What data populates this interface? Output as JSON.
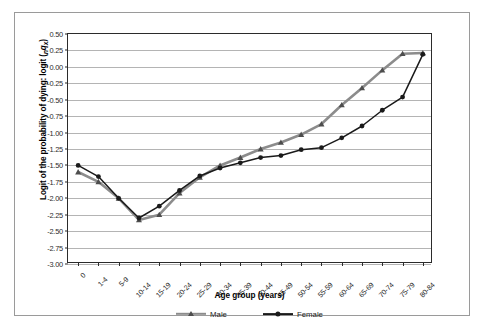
{
  "chart_data": {
    "type": "line",
    "title": "",
    "xlabel": "Age group (years)",
    "ylabel": "Logit of the probability of dying: logit (nqx)",
    "ylabel_parts": {
      "main": "Logit of the probability of dying: logit (",
      "sub_n": "n",
      "var_q": "q",
      "sub_x": "x",
      "close": ")"
    },
    "categories": [
      "0",
      "1-4",
      "5-9",
      "10-14",
      "15-19",
      "20-24",
      "25-29",
      "30-34",
      "35-39",
      "40-44",
      "45-49",
      "50-54",
      "55-59",
      "60-64",
      "65-69",
      "70-74",
      "75-79",
      "80-84"
    ],
    "ylim": [
      -3.0,
      0.5
    ],
    "ytick_labels": [
      "0.50",
      "0.25",
      "0.00",
      "-0.25",
      "-0.50",
      "-0.75",
      "-1.00",
      "-1.25",
      "-1.50",
      "-1.75",
      "-2.00",
      "-2.25",
      "-2.50",
      "-2.75",
      "-3.00"
    ],
    "ytick_values": [
      0.5,
      0.25,
      0.0,
      -0.25,
      -0.5,
      -0.75,
      -1.0,
      -1.25,
      -1.5,
      -1.75,
      -2.0,
      -2.25,
      -2.5,
      -2.75,
      -3.0
    ],
    "grid": true,
    "legend_position": "bottom",
    "series": [
      {
        "name": "Male",
        "color": "#8c8c8c",
        "marker": "triangle",
        "values": [
          -1.6,
          -1.75,
          -2.0,
          -2.33,
          -2.25,
          -1.92,
          -1.68,
          -1.5,
          -1.38,
          -1.25,
          -1.15,
          -1.03,
          -0.87,
          -0.58,
          -0.32,
          -0.05,
          0.2,
          0.21
        ]
      },
      {
        "name": "Female",
        "color": "#1a1a1a",
        "marker": "circle",
        "values": [
          -1.5,
          -1.67,
          -2.0,
          -2.3,
          -2.12,
          -1.88,
          -1.66,
          -1.54,
          -1.46,
          -1.38,
          -1.35,
          -1.26,
          -1.23,
          -1.08,
          -0.9,
          -0.66,
          -0.46,
          0.19
        ]
      }
    ]
  },
  "legend": {
    "items": [
      {
        "label": "Male"
      },
      {
        "label": "Female"
      }
    ]
  },
  "colors": {
    "male": "#8c8c8c",
    "female": "#1a1a1a",
    "gridline": "#b4b4b4",
    "axis": "#2b2b2b",
    "frame": "#9a9a9a",
    "background": "#ffffff"
  }
}
